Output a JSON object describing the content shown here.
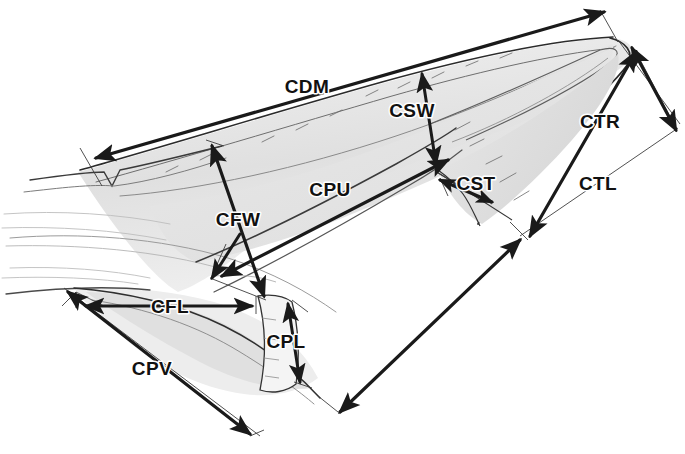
{
  "figure": {
    "background_color": "#ffffff",
    "ink_color": "#1a1a1a",
    "shade_color": "#e2e2e2",
    "faint_color": "#9a9a9a",
    "width": 685,
    "height": 454
  },
  "labels": [
    {
      "id": "CDM",
      "text": "CDM",
      "x": 307,
      "y": 93,
      "measure": "claw dorsal midline length"
    },
    {
      "id": "CSW",
      "text": "CSW",
      "x": 412,
      "y": 117,
      "measure": "claw sheath width"
    },
    {
      "id": "CTR",
      "text": "CTR",
      "x": 580,
      "y": 128,
      "measure": "claw tip to rear"
    },
    {
      "id": "CTL",
      "text": "CTL",
      "x": 578,
      "y": 190,
      "measure": "claw tip length"
    },
    {
      "id": "CPU",
      "text": "CPU",
      "x": 303,
      "y": 196,
      "measure": "claw proximal to upper"
    },
    {
      "id": "CST",
      "text": "CST",
      "x": 455,
      "y": 188,
      "measure": "claw sheath thickness"
    },
    {
      "id": "CFW",
      "text": "CFW",
      "x": 215,
      "y": 226,
      "measure": "claw frontal width"
    },
    {
      "id": "CFL",
      "text": "CFL",
      "x": 150,
      "y": 315,
      "measure": "claw frontal length"
    },
    {
      "id": "CPL",
      "text": "CPL",
      "x": 270,
      "y": 347,
      "measure": "claw pad length"
    },
    {
      "id": "CPV",
      "text": "CPV",
      "x": 150,
      "y": 375,
      "measure": "claw palmar ventral length"
    }
  ],
  "arrows": [
    {
      "id": "CDM-arrow",
      "heads": "double",
      "from": [
        88,
        160
      ],
      "to": [
        608,
        14
      ],
      "style": "long-axis"
    },
    {
      "id": "CSW-arrow",
      "heads": "double",
      "from": [
        432,
        166
      ],
      "to": [
        424,
        76
      ],
      "style": "vertical-short"
    },
    {
      "id": "CTR-arrow",
      "heads": "double",
      "from": [
        528,
        238
      ],
      "to": [
        638,
        52
      ],
      "style": "diagonal"
    },
    {
      "id": "CTL-arrow",
      "heads": "double",
      "from": [
        633,
        46
      ],
      "to": [
        672,
        127
      ],
      "style": "short-diagonal"
    },
    {
      "id": "CPU-arrow",
      "heads": "double",
      "from": [
        232,
        272
      ],
      "to": [
        444,
        162
      ],
      "style": "diagonal"
    },
    {
      "id": "CST-arrow",
      "heads": "double",
      "from": [
        440,
        180
      ],
      "to": [
        490,
        200
      ],
      "style": "short-diagonal"
    },
    {
      "id": "CFW-arrow",
      "heads": "double",
      "from": [
        262,
        298
      ],
      "to": [
        212,
        143
      ],
      "style": "vertical"
    },
    {
      "id": "CFL-arrow",
      "heads": "double",
      "from": [
        84,
        305
      ],
      "to": [
        254,
        305
      ],
      "style": "horizontal"
    },
    {
      "id": "CPL-arrow",
      "heads": "double",
      "from": [
        290,
        302
      ],
      "to": [
        300,
        380
      ],
      "style": "vertical-short"
    },
    {
      "id": "CPV-arrow",
      "heads": "double",
      "from": [
        66,
        290
      ],
      "to": [
        250,
        434
      ],
      "style": "diagonal"
    }
  ],
  "drawing": {
    "subject": "hand-drawn shaded sketch of a claw / nail in lateral view",
    "elements": [
      "dorsal claw plate outline",
      "claw sheath and tip",
      "ventral pad and sole",
      "faint hair / texture strokes"
    ]
  }
}
